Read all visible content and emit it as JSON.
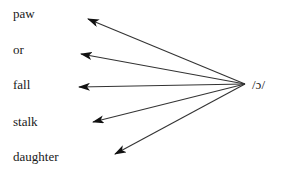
{
  "diagram": {
    "source": {
      "label": "/ɔ/",
      "x": 252,
      "y": 78,
      "point": [
        245,
        84
      ]
    },
    "words": [
      {
        "label": "paw",
        "x": 13,
        "y": 7,
        "tip": [
          88,
          19
        ]
      },
      {
        "label": "or",
        "x": 13,
        "y": 43,
        "tip": [
          81,
          54
        ]
      },
      {
        "label": "fall",
        "x": 13,
        "y": 78,
        "tip": [
          79,
          87
        ]
      },
      {
        "label": "stalk",
        "x": 13,
        "y": 115,
        "tip": [
          93,
          122
        ]
      },
      {
        "label": "daughter",
        "x": 13,
        "y": 150,
        "tip": [
          115,
          154
        ]
      }
    ],
    "colors": {
      "line": "#333333",
      "text": "#1a1a1a",
      "background": "#ffffff"
    }
  }
}
